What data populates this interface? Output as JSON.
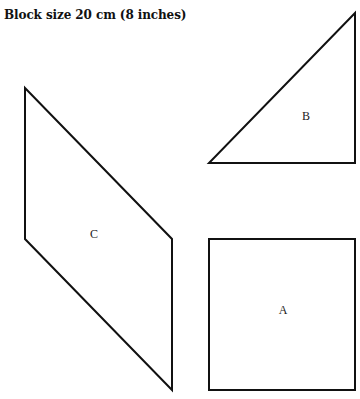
{
  "title": "Block size 20 cm (8 inches)",
  "stroke_color": "#111111",
  "background_color": "#ffffff",
  "shapes": [
    {
      "id": "A",
      "label": "A",
      "type": "square",
      "points": [
        [
          209,
          239
        ],
        [
          355,
          239
        ],
        [
          355,
          390
        ],
        [
          209,
          390
        ]
      ],
      "label_pos": [
        283,
        314
      ]
    },
    {
      "id": "B",
      "label": "B",
      "type": "right-triangle",
      "points": [
        [
          355,
          13
        ],
        [
          355,
          163
        ],
        [
          209,
          163
        ]
      ],
      "label_pos": [
        306,
        120
      ]
    },
    {
      "id": "C",
      "label": "C",
      "type": "parallelogram",
      "points": [
        [
          25,
          88
        ],
        [
          172,
          239
        ],
        [
          172,
          390
        ],
        [
          25,
          239
        ]
      ],
      "label_pos": [
        94,
        238
      ]
    }
  ]
}
